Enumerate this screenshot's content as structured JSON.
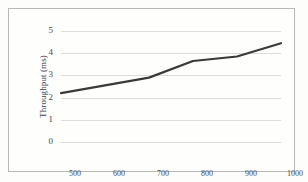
{
  "chart_data": {
    "type": "line",
    "title": "",
    "xlabel": "No of Requests",
    "ylabel": "Throughput (ms)",
    "x": [
      500,
      600,
      700,
      800,
      900,
      1000
    ],
    "values": [
      2.2,
      2.55,
      2.9,
      3.65,
      3.85,
      4.45
    ],
    "series": [
      {
        "name": "Throughput",
        "values": [
          2.2,
          2.55,
          2.9,
          3.65,
          3.85,
          4.45
        ],
        "color": "#3a3a3a"
      }
    ],
    "xtick_labels": [
      "500",
      "600",
      "700",
      "800",
      "900",
      "1000"
    ],
    "ytick_labels": [
      "0",
      "1",
      "2",
      "3",
      "4",
      "5"
    ],
    "ytick_values": [
      0,
      1,
      2,
      3,
      4,
      5
    ],
    "ylim": [
      0,
      5
    ],
    "xlim": [
      500,
      1000
    ],
    "grid": "horizontal",
    "legend": "none",
    "line_width": 2.2
  },
  "figure": {
    "border_color": "#b9b9b4",
    "grid_color": "#dcdcd8",
    "background": "#fefefd",
    "text_color": "#4a4a48"
  }
}
